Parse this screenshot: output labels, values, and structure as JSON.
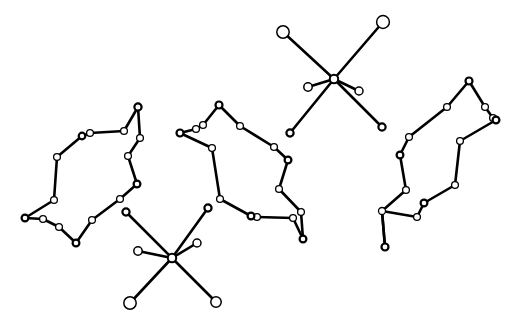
{
  "figure": {
    "title": "",
    "background_color": "#ffffff",
    "width": 517,
    "height": 328,
    "node_fill": "#ffffff",
    "node_stroke": "#000000",
    "edge_color": "#000000"
  },
  "chart_data": {
    "type": "scatter",
    "title": "",
    "subtitle": "",
    "xlabel": "",
    "ylabel": "",
    "xlim": [
      0,
      517
    ],
    "ylim": [
      0,
      328
    ],
    "grid": false,
    "legend": null,
    "annotations": [],
    "components": [
      {
        "name": "left-ring",
        "kind": "cycle",
        "node_count": 17,
        "edge_count": 17,
        "nodes": [
          {
            "id": "L0",
            "x": 138,
            "y": 107,
            "r": 3.6,
            "lw": 2.2
          },
          {
            "id": "L1",
            "x": 124,
            "y": 131,
            "r": 3.4,
            "lw": 1.3
          },
          {
            "id": "L2",
            "x": 90,
            "y": 133,
            "r": 3.4,
            "lw": 1.3
          },
          {
            "id": "L3",
            "x": 82,
            "y": 136,
            "r": 3.3,
            "lw": 2.2
          },
          {
            "id": "L4",
            "x": 57,
            "y": 157,
            "r": 3.4,
            "lw": 1.3
          },
          {
            "id": "L5",
            "x": 54,
            "y": 200,
            "r": 3.4,
            "lw": 1.3
          },
          {
            "id": "L6",
            "x": 25,
            "y": 218,
            "r": 3.4,
            "lw": 2.2
          },
          {
            "id": "L7",
            "x": 43,
            "y": 219,
            "r": 3.4,
            "lw": 1.3
          },
          {
            "id": "L8",
            "x": 59,
            "y": 227,
            "r": 3.4,
            "lw": 1.3
          },
          {
            "id": "L9",
            "x": 76,
            "y": 243,
            "r": 3.4,
            "lw": 2.2
          },
          {
            "id": "L10",
            "x": 92,
            "y": 220,
            "r": 3.4,
            "lw": 1.3
          },
          {
            "id": "L11",
            "x": 120,
            "y": 199,
            "r": 3.4,
            "lw": 1.3
          },
          {
            "id": "L12",
            "x": 137,
            "y": 184,
            "r": 3.4,
            "lw": 2.2
          },
          {
            "id": "L13",
            "x": 128,
            "y": 156,
            "r": 3.4,
            "lw": 1.3
          },
          {
            "id": "L14",
            "x": 140,
            "y": 138,
            "r": 3.4,
            "lw": 1.3
          },
          {
            "id": "L15",
            "x": 120,
            "y": 129,
            "r": 0,
            "lw": 0
          },
          {
            "id": "L16",
            "x": 136,
            "y": 110,
            "r": 0,
            "lw": 0
          }
        ],
        "edges": [
          [
            "L0",
            "L1"
          ],
          [
            "L1",
            "L2"
          ],
          [
            "L2",
            "L3"
          ],
          [
            "L3",
            "L4"
          ],
          [
            "L4",
            "L5"
          ],
          [
            "L5",
            "L6"
          ],
          [
            "L6",
            "L7"
          ],
          [
            "L7",
            "L8"
          ],
          [
            "L8",
            "L9"
          ],
          [
            "L9",
            "L10"
          ],
          [
            "L10",
            "L11"
          ],
          [
            "L11",
            "L12"
          ],
          [
            "L12",
            "L13"
          ],
          [
            "L13",
            "L14"
          ],
          [
            "L14",
            "L0"
          ]
        ]
      },
      {
        "name": "middle-ring",
        "kind": "cycle",
        "node_count": 15,
        "edge_count": 15,
        "nodes": [
          {
            "id": "M0",
            "x": 219,
            "y": 105,
            "r": 3.5,
            "lw": 2.2
          },
          {
            "id": "M1",
            "x": 240,
            "y": 126,
            "r": 3.4,
            "lw": 1.3
          },
          {
            "id": "M2",
            "x": 274,
            "y": 147,
            "r": 3.4,
            "lw": 1.3
          },
          {
            "id": "M3",
            "x": 288,
            "y": 160,
            "r": 3.4,
            "lw": 2.2
          },
          {
            "id": "M4",
            "x": 279,
            "y": 189,
            "r": 3.4,
            "lw": 1.3
          },
          {
            "id": "M5",
            "x": 301,
            "y": 212,
            "r": 3.4,
            "lw": 1.3
          },
          {
            "id": "M6",
            "x": 303,
            "y": 239,
            "r": 3.4,
            "lw": 2.2
          },
          {
            "id": "M7",
            "x": 293,
            "y": 218,
            "r": 3.4,
            "lw": 1.3
          },
          {
            "id": "M8",
            "x": 257,
            "y": 217,
            "r": 3.4,
            "lw": 1.3
          },
          {
            "id": "M9",
            "x": 251,
            "y": 216,
            "r": 3.4,
            "lw": 2.2
          },
          {
            "id": "M10",
            "x": 220,
            "y": 199,
            "r": 3.4,
            "lw": 1.3
          },
          {
            "id": "M11",
            "x": 212,
            "y": 148,
            "r": 3.4,
            "lw": 1.3
          },
          {
            "id": "M12",
            "x": 180,
            "y": 133,
            "r": 3.5,
            "lw": 2.2
          },
          {
            "id": "M13",
            "x": 196,
            "y": 129,
            "r": 3.4,
            "lw": 1.3
          },
          {
            "id": "M14",
            "x": 203,
            "y": 125,
            "r": 3.4,
            "lw": 1.3
          }
        ],
        "edges": [
          [
            "M0",
            "M1"
          ],
          [
            "M1",
            "M2"
          ],
          [
            "M2",
            "M3"
          ],
          [
            "M3",
            "M4"
          ],
          [
            "M4",
            "M5"
          ],
          [
            "M5",
            "M6"
          ],
          [
            "M6",
            "M7"
          ],
          [
            "M7",
            "M8"
          ],
          [
            "M8",
            "M9"
          ],
          [
            "M9",
            "M10"
          ],
          [
            "M10",
            "M11"
          ],
          [
            "M11",
            "M12"
          ],
          [
            "M12",
            "M13"
          ],
          [
            "M13",
            "M14"
          ],
          [
            "M14",
            "M0"
          ]
        ]
      },
      {
        "name": "right-ring",
        "kind": "cycle",
        "node_count": 14,
        "edge_count": 14,
        "nodes": [
          {
            "id": "R0",
            "x": 469,
            "y": 81,
            "r": 3.5,
            "lw": 2.2
          },
          {
            "id": "R1",
            "x": 485,
            "y": 107,
            "r": 3.4,
            "lw": 1.3
          },
          {
            "id": "R2",
            "x": 493,
            "y": 118,
            "r": 3.4,
            "lw": 1.3
          },
          {
            "id": "R3",
            "x": 496,
            "y": 120,
            "r": 3.4,
            "lw": 2.2
          },
          {
            "id": "R4",
            "x": 460,
            "y": 141,
            "r": 3.4,
            "lw": 1.3
          },
          {
            "id": "R5",
            "x": 455,
            "y": 185,
            "r": 3.4,
            "lw": 1.3
          },
          {
            "id": "R6",
            "x": 424,
            "y": 203,
            "r": 3.4,
            "lw": 2.2
          },
          {
            "id": "R7",
            "x": 417,
            "y": 217,
            "r": 3.4,
            "lw": 1.3
          },
          {
            "id": "R8",
            "x": 385,
            "y": 247,
            "r": 3.5,
            "lw": 2.2
          },
          {
            "id": "R9",
            "x": 382,
            "y": 211,
            "r": 3.5,
            "lw": 1.3
          },
          {
            "id": "R10",
            "x": 406,
            "y": 190,
            "r": 3.4,
            "lw": 1.3
          },
          {
            "id": "R11",
            "x": 400,
            "y": 155,
            "r": 3.4,
            "lw": 2.2
          },
          {
            "id": "R12",
            "x": 409,
            "y": 137,
            "r": 3.4,
            "lw": 1.3
          },
          {
            "id": "R13",
            "x": 447,
            "y": 107,
            "r": 3.4,
            "lw": 1.3
          }
        ],
        "edges": [
          [
            "R0",
            "R1"
          ],
          [
            "R1",
            "R2"
          ],
          [
            "R2",
            "R3"
          ],
          [
            "R3",
            "R4"
          ],
          [
            "R4",
            "R5"
          ],
          [
            "R5",
            "R6"
          ],
          [
            "R6",
            "R7"
          ],
          [
            "R7",
            "R9"
          ],
          [
            "R9",
            "R8"
          ],
          [
            "R8",
            "R9"
          ],
          [
            "R9",
            "R10"
          ],
          [
            "R10",
            "R11"
          ],
          [
            "R11",
            "R12"
          ],
          [
            "R12",
            "R13"
          ],
          [
            "R13",
            "R0"
          ]
        ]
      },
      {
        "name": "upper-right-star",
        "kind": "star",
        "node_count": 7,
        "edge_count": 6,
        "hub": "S1H",
        "nodes": [
          {
            "id": "S1H",
            "x": 334,
            "y": 79,
            "r": 4.2,
            "lw": 2.0
          },
          {
            "id": "S1A",
            "x": 283,
            "y": 32,
            "r": 6.2,
            "lw": 1.5
          },
          {
            "id": "S1B",
            "x": 383,
            "y": 22,
            "r": 6.4,
            "lw": 1.5
          },
          {
            "id": "S1C",
            "x": 308,
            "y": 87,
            "r": 4.2,
            "lw": 1.5
          },
          {
            "id": "S1D",
            "x": 359,
            "y": 91,
            "r": 4.0,
            "lw": 1.5
          },
          {
            "id": "S1E",
            "x": 290,
            "y": 133,
            "r": 3.6,
            "lw": 2.2
          },
          {
            "id": "S1F",
            "x": 382,
            "y": 127,
            "r": 3.6,
            "lw": 2.2
          }
        ],
        "edges": [
          [
            "S1H",
            "S1A"
          ],
          [
            "S1H",
            "S1B"
          ],
          [
            "S1H",
            "S1C"
          ],
          [
            "S1H",
            "S1D"
          ],
          [
            "S1H",
            "S1E"
          ],
          [
            "S1H",
            "S1F"
          ]
        ]
      },
      {
        "name": "lower-left-star",
        "kind": "star",
        "node_count": 7,
        "edge_count": 6,
        "hub": "S2H",
        "nodes": [
          {
            "id": "S2H",
            "x": 172,
            "y": 258,
            "r": 4.2,
            "lw": 2.0
          },
          {
            "id": "S2A",
            "x": 126,
            "y": 212,
            "r": 3.6,
            "lw": 2.2
          },
          {
            "id": "S2B",
            "x": 208,
            "y": 208,
            "r": 3.6,
            "lw": 2.2
          },
          {
            "id": "S2C",
            "x": 138,
            "y": 251,
            "r": 4.2,
            "lw": 1.5
          },
          {
            "id": "S2D",
            "x": 197,
            "y": 243,
            "r": 4.0,
            "lw": 1.5
          },
          {
            "id": "S2E",
            "x": 130,
            "y": 303,
            "r": 6.2,
            "lw": 1.5
          },
          {
            "id": "S2F",
            "x": 216,
            "y": 302,
            "r": 5.2,
            "lw": 1.5
          }
        ],
        "edges": [
          [
            "S2H",
            "S2A"
          ],
          [
            "S2H",
            "S2B"
          ],
          [
            "S2H",
            "S2C"
          ],
          [
            "S2H",
            "S2D"
          ],
          [
            "S2H",
            "S2E"
          ],
          [
            "S2H",
            "S2F"
          ]
        ]
      }
    ]
  }
}
